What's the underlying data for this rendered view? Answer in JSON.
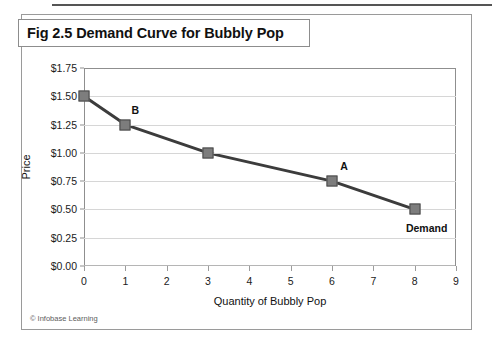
{
  "figure": {
    "title": "Fig 2.5 Demand Curve for Bubbly Pop",
    "credit": "© Infobase Learning"
  },
  "chart_data": {
    "type": "line",
    "title": "Fig 2.5 Demand Curve for Bubbly Pop",
    "xlabel": "Quantity of Bubbly Pop",
    "ylabel": "Price",
    "xlim": [
      0,
      9
    ],
    "ylim": [
      0,
      1.75
    ],
    "grid": "horizontal",
    "legend": "none",
    "x_ticks": [
      "0",
      "1",
      "2",
      "3",
      "4",
      "5",
      "6",
      "7",
      "8",
      "9"
    ],
    "x_tick_values": [
      0,
      1,
      2,
      3,
      4,
      5,
      6,
      7,
      8,
      9
    ],
    "y_ticks": [
      "$0.00",
      "$0.25",
      "$0.50",
      "$0.75",
      "$1.00",
      "$1.25",
      "$1.50",
      "$1.75"
    ],
    "y_tick_values": [
      0,
      0.25,
      0.5,
      0.75,
      1.0,
      1.25,
      1.5,
      1.75
    ],
    "series": [
      {
        "name": "Demand",
        "color": "#3c3c3c",
        "marker_color": "#7d7d7d",
        "x": [
          0,
          1,
          3,
          6,
          8
        ],
        "y": [
          1.5,
          1.25,
          1.0,
          0.75,
          0.5
        ],
        "point_labels": [
          "",
          "B",
          "",
          "A",
          "Demand"
        ]
      }
    ],
    "annotations": [
      {
        "text": "B",
        "x": 1,
        "y": 1.25
      },
      {
        "text": "A",
        "x": 6,
        "y": 0.75
      },
      {
        "text": "Demand",
        "x": 8,
        "y": 0.5
      }
    ]
  }
}
